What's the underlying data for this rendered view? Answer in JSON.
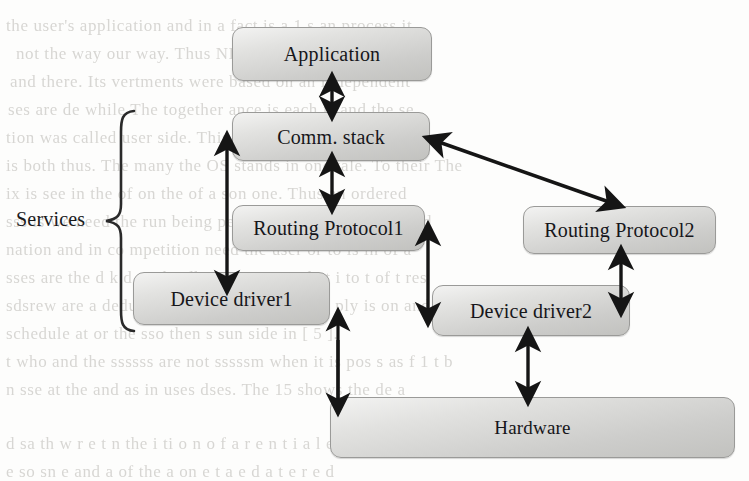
{
  "page": {
    "width": 749,
    "height": 481,
    "background_color": "#fdfdfc",
    "kind": "scanned-book-figure"
  },
  "diagram": {
    "title": "",
    "group_label": "Services",
    "node_fill_light": "#f3f3f2",
    "node_fill_dark": "#c2c2bf",
    "node_border_color": "#9a9a98",
    "arrow_color": "#151515",
    "nodes": [
      {
        "id": "application",
        "label": "Application",
        "x": 232,
        "y": 27,
        "w": 200,
        "h": 54
      },
      {
        "id": "comm-stack",
        "label": "Comm. stack",
        "x": 232,
        "y": 112,
        "w": 198,
        "h": 49
      },
      {
        "id": "routing-1",
        "label": "Routing Protocol1",
        "x": 232,
        "y": 205,
        "w": 193,
        "h": 46
      },
      {
        "id": "routing-2",
        "label": "Routing Protocol2",
        "x": 523,
        "y": 206,
        "w": 193,
        "h": 48
      },
      {
        "id": "device-1",
        "label": "Device driver1",
        "x": 133,
        "y": 272,
        "w": 197,
        "h": 53
      },
      {
        "id": "device-2",
        "label": "Device driver2",
        "x": 432,
        "y": 285,
        "w": 198,
        "h": 51
      },
      {
        "id": "hardware",
        "label": "Hardware",
        "x": 330,
        "y": 397,
        "w": 405,
        "h": 61
      }
    ],
    "connections": [
      {
        "id": "app-to-comm",
        "from": "application",
        "to": "comm-stack",
        "style": "double-arrow",
        "orientation": "vertical"
      },
      {
        "id": "comm-to-routing1",
        "from": "comm-stack",
        "to": "routing-1",
        "style": "double-arrow",
        "orientation": "vertical"
      },
      {
        "id": "comm-to-routing2",
        "from": "comm-stack",
        "to": "routing-2",
        "style": "double-arrow",
        "orientation": "diagonal"
      },
      {
        "id": "comm-to-device1",
        "from": "comm-stack",
        "to": "device-1",
        "style": "double-arrow",
        "orientation": "vertical-left"
      },
      {
        "id": "routing1-to-device2",
        "from": "routing-1",
        "to": "device-2",
        "style": "double-arrow",
        "orientation": "vertical"
      },
      {
        "id": "routing2-to-device2",
        "from": "routing-2",
        "to": "device-2",
        "style": "double-arrow",
        "orientation": "vertical"
      },
      {
        "id": "device1-to-hardware",
        "from": "device-1",
        "to": "hardware",
        "style": "double-arrow",
        "orientation": "vertical"
      },
      {
        "id": "device2-to-hardware",
        "from": "device-2",
        "to": "hardware",
        "style": "double-arrow",
        "orientation": "vertical"
      }
    ]
  },
  "bleed_text": {
    "note": "faint mirrored show-through text from reverse page",
    "lines": [
      {
        "text": "the user's application and in a fact is a 1 s an process it",
        "x": 6,
        "y": 16
      },
      {
        "text": "not the way our way. Thus NIOS a task ends",
        "x": 16,
        "y": 44
      },
      {
        "text": "and there. Its  vertments were based on an independent",
        "x": 10,
        "y": 72
      },
      {
        "text": "ses  are  de while  The  together  ance is each is and the  se",
        "x": 8,
        "y": 100
      },
      {
        "text": "tion was called user side. This is handled as the are up on",
        "x": 6,
        "y": 128
      },
      {
        "text": "is both thus. The many the  OS  stands in one  tale. To their  The",
        "x": 6,
        "y": 156
      },
      {
        "text": "ix is see in  the  of on  the  of  a  son  one.  Thus  an  ordered",
        "x": 6,
        "y": 184
      },
      {
        "text": "sss is  we need  the  run  being  per  tempo  time  the  time  is  sd",
        "x": 6,
        "y": 212
      },
      {
        "text": "nation  and  in  co  mpetition  need  the  user  or  to  is  in  of  a",
        "x": 6,
        "y": 240
      },
      {
        "text": "sses  are  the  d  k  d  as  the  dk  us  sent  as  in  d  at  i  to  t  of  t  res",
        "x": 6,
        "y": 268
      },
      {
        "text": "sdsrew  are  a  deduded  as  it  in  its  need  ply  so  ply  is  on  and  in",
        "x": 6,
        "y": 296
      },
      {
        "text": "schedule  at  or  the  sso  then  s  sun  side  in  [ 5 ].",
        "x": 6,
        "y": 324
      },
      {
        "text": "t  who  and  the  ssssss  are  not  sssssm  when  it  is  pos  s  as  f  1  t  b",
        "x": 6,
        "y": 352
      },
      {
        "text": "n  sse  at  the  and  as  in  uses  dses.  The  15  shows  the  de  a",
        "x": 6,
        "y": 380
      },
      {
        "text": "d  sa  th  w  r  e  t  n  the  i  ti  o  n  o  f  a  r  e  n  t  i  a  l  e  d",
        "x": 6,
        "y": 434
      },
      {
        "text": "e  so  sn  e  and  a  of  the  a  on  e  t  a  e  d  a  t  e  r  e  d",
        "x": 6,
        "y": 462
      }
    ]
  }
}
